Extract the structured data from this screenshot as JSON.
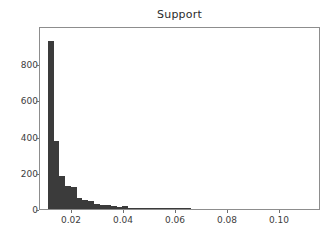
{
  "chart_data": {
    "type": "bar",
    "title": "Support",
    "xlabel": "",
    "ylabel": "",
    "grid": false,
    "legend": null,
    "xlim": [
      0.0077,
      0.1158
    ],
    "ylim": [
      0,
      1010
    ],
    "xticks": [
      0.02,
      0.04,
      0.06,
      0.08,
      0.1
    ],
    "xtick_labels": [
      "0.02",
      "0.04",
      "0.06",
      "0.08",
      "0.10"
    ],
    "yticks": [
      0,
      200,
      400,
      600,
      800
    ],
    "ytick_labels": [
      "0",
      "200",
      "400",
      "600",
      "800"
    ],
    "bar_color": "#3b3b3b",
    "bin_width": 0.0022,
    "bin_starts": [
      0.0108,
      0.013,
      0.0152,
      0.0174,
      0.0196,
      0.0218,
      0.024,
      0.0262,
      0.0284,
      0.0306,
      0.0328,
      0.035,
      0.0372,
      0.0394,
      0.0416,
      0.0438,
      0.046,
      0.0482,
      0.0504,
      0.0526,
      0.0548,
      0.057,
      0.0592,
      0.0614,
      0.0636
    ],
    "categories": [
      "0.0108",
      "0.0130",
      "0.0152",
      "0.0174",
      "0.0196",
      "0.0218",
      "0.0240",
      "0.0262",
      "0.0284",
      "0.0306",
      "0.0328",
      "0.0350",
      "0.0372",
      "0.0394",
      "0.0416",
      "0.0438",
      "0.0460",
      "0.0482",
      "0.0504",
      "0.0526",
      "0.0548",
      "0.0570",
      "0.0592",
      "0.0614",
      "0.0636"
    ],
    "values": [
      930,
      375,
      180,
      128,
      120,
      62,
      50,
      44,
      30,
      24,
      20,
      14,
      10,
      17,
      8,
      7,
      6,
      5,
      4,
      7,
      3,
      2,
      2,
      1,
      3
    ]
  }
}
